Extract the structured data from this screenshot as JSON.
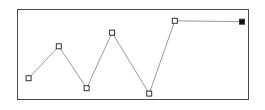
{
  "drawing": {
    "type": "polyline",
    "line_color": "#9a9a9a",
    "frame_color": "#4a4a4a",
    "handle_stroke": "#333333",
    "handle_fill": "#ffffff",
    "end_handle_fill": "#111111",
    "vertices": [
      {
        "x": 0.05,
        "y": 0.76,
        "kind": "open"
      },
      {
        "x": 0.18,
        "y": 0.41,
        "kind": "open"
      },
      {
        "x": 0.3,
        "y": 0.87,
        "kind": "open"
      },
      {
        "x": 0.41,
        "y": 0.26,
        "kind": "open"
      },
      {
        "x": 0.57,
        "y": 0.93,
        "kind": "open"
      },
      {
        "x": 0.68,
        "y": 0.13,
        "kind": "open"
      },
      {
        "x": 0.97,
        "y": 0.14,
        "kind": "filled"
      }
    ]
  }
}
